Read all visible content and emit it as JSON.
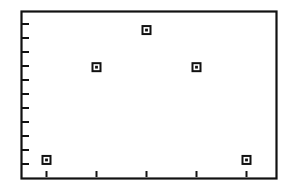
{
  "figure": {
    "background_color": "#ffffff",
    "frame_color": "#111111",
    "marker_color": "#111111",
    "title": "",
    "caption": ""
  },
  "chart_data": {
    "type": "scatter",
    "title": "",
    "subtitle": "",
    "xlabel": "",
    "ylabel": "",
    "x": [
      1,
      2,
      3,
      4,
      5
    ],
    "y": [
      1,
      6,
      8,
      6,
      1
    ],
    "tick_labels": {
      "x": [
        "",
        "",
        "",
        "",
        ""
      ],
      "y": [
        "",
        "",
        "",
        "",
        "",
        "",
        "",
        "",
        "",
        "",
        "",
        ""
      ]
    },
    "xlim": [
      0.5,
      5.6
    ],
    "ylim": [
      0,
      9
    ],
    "grid": false,
    "legend": null,
    "annotations": [],
    "series": [
      {
        "name": "series-1",
        "marker": "square-with-center-dot",
        "points": [
          {
            "x": 1,
            "y": 1
          },
          {
            "x": 2,
            "y": 6
          },
          {
            "x": 3,
            "y": 8
          },
          {
            "x": 4,
            "y": 6
          },
          {
            "x": 5,
            "y": 1
          }
        ]
      }
    ],
    "x_tick_count": 5,
    "y_tick_count": 12
  },
  "accessibility": {
    "figure_description": "Scatter plot with five square markers forming an inverted V pattern",
    "point_labels": [
      "point-1",
      "point-2",
      "point-3",
      "point-4",
      "point-5"
    ]
  }
}
